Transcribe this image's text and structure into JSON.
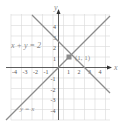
{
  "diagram": {
    "title": "",
    "axes": {
      "x_label": "x",
      "y_label": "y",
      "x_range": [
        -4.5,
        4.5
      ],
      "y_range": [
        -4.8,
        4.8
      ],
      "x_ticks": [
        "-4",
        "-3",
        "-2",
        "-1",
        "1",
        "2",
        "3",
        "4"
      ],
      "y_ticks": [
        "4",
        "3",
        "2",
        "1",
        "-1",
        "-2",
        "-3",
        "-4"
      ],
      "grid": true
    },
    "lines": [
      {
        "name": "x + y = 2",
        "label": "x + y = 2",
        "slope": -1,
        "intercept": 2,
        "color": "#8c8c8c"
      },
      {
        "name": "y = x",
        "label": "y = x",
        "slope": 1,
        "intercept": 0,
        "color": "#8c8c8c"
      }
    ],
    "intersection": {
      "label": "(1, 1)",
      "x": 1,
      "y": 1,
      "color": "#8c8c8c"
    },
    "colors": {
      "grid": "#d9d9d9",
      "axis": "#333333",
      "line": "#8c8c8c",
      "label": "#8a8a8a"
    }
  }
}
